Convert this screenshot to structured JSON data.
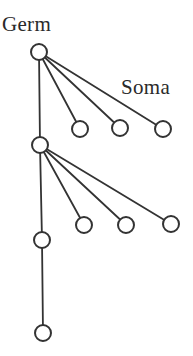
{
  "labels": {
    "germ": "Germ",
    "soma": "Soma"
  },
  "colors": {
    "stroke": "#333333",
    "node_fill": "#ffffff",
    "text": "#2a2a2a",
    "background": "#ffffff"
  },
  "diagram": {
    "type": "tree",
    "node_radius": 8,
    "germ_line": [
      {
        "id": "g1",
        "x": 39,
        "y": 52
      },
      {
        "id": "g2",
        "x": 40,
        "y": 145
      },
      {
        "id": "g3",
        "x": 42,
        "y": 240
      },
      {
        "id": "g4",
        "x": 43,
        "y": 333
      }
    ],
    "soma_branches": [
      {
        "parent": "g1",
        "children": [
          {
            "id": "s1a",
            "x": 80,
            "y": 129
          },
          {
            "id": "s1b",
            "x": 120,
            "y": 128
          },
          {
            "id": "s1c",
            "x": 163,
            "y": 129
          }
        ]
      },
      {
        "parent": "g2",
        "children": [
          {
            "id": "s2a",
            "x": 84,
            "y": 225
          },
          {
            "id": "s2b",
            "x": 126,
            "y": 225
          },
          {
            "id": "s2c",
            "x": 171,
            "y": 224
          }
        ]
      }
    ]
  }
}
